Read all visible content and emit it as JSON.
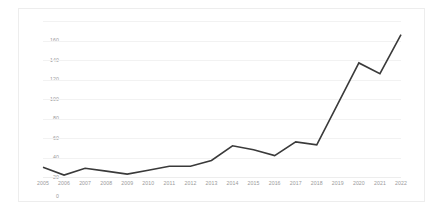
{
  "chart_data": {
    "type": "line",
    "title": "",
    "subtitle": "",
    "xlabel": "",
    "ylabel": "",
    "categories": [
      "2005",
      "2006",
      "2007",
      "2008",
      "2009",
      "2010",
      "2011",
      "2012",
      "2013",
      "2014",
      "2015",
      "2016",
      "2017",
      "2018",
      "2019",
      "2020",
      "2021",
      "2022"
    ],
    "series": [
      {
        "name": "",
        "color": "#3a3a3a",
        "values": [
          10,
          2,
          9,
          6,
          3,
          7,
          11,
          11,
          17,
          32,
          28,
          22,
          36,
          33,
          75,
          117,
          106,
          146
        ]
      }
    ],
    "ylim": [
      0,
      160
    ],
    "ytick_values": [
      0,
      20,
      40,
      60,
      80,
      100,
      120,
      140,
      160
    ],
    "ytick_labels": [
      "0",
      "20",
      "40",
      "60",
      "80",
      "100",
      "120",
      "140",
      "160"
    ],
    "xtick_labels": [
      "2005",
      "2006",
      "2007",
      "2008",
      "2009",
      "2010",
      "2011",
      "2012",
      "2013",
      "2014",
      "2015",
      "2016",
      "2017",
      "2018",
      "2019",
      "2020",
      "2021",
      "2022"
    ],
    "grid": true,
    "grid_axis": "y",
    "grid_color": "#f2f2f2",
    "legend": false,
    "legend_position": "none",
    "frame_color": "#ededed",
    "tick_label_color": "#9a9a9a",
    "background": "#ffffff",
    "markers": false,
    "line_width": 1.6,
    "annotations": []
  }
}
